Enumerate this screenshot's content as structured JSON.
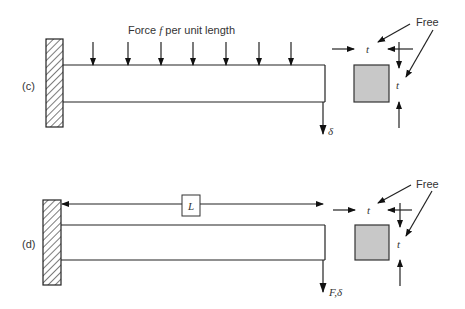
{
  "panels": [
    {
      "id": "c",
      "label": "(c)",
      "load_label_prefix": "Force ",
      "load_label_var": "f",
      "load_label_suffix": " per unit length",
      "tip_label": "δ",
      "free_label": "Free",
      "thickness_top": "t",
      "thickness_side": "t",
      "load_arrow_count": 7
    },
    {
      "id": "d",
      "label": "(d)",
      "length_label": "L",
      "tip_label_force": "F",
      "tip_label_sep": ",",
      "tip_label_delta": "δ",
      "free_label": "Free",
      "thickness_top": "t",
      "thickness_side": "t"
    }
  ],
  "colors": {
    "line": "#222222",
    "cross_section_fill": "#c8c8c8",
    "text": "#333333"
  }
}
